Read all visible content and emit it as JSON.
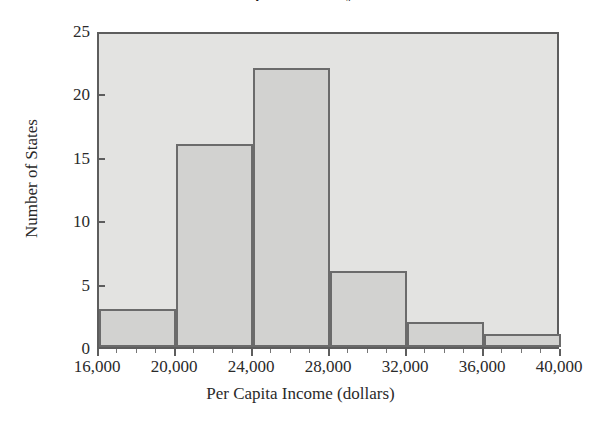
{
  "chart_data": {
    "type": "bar",
    "title": "Per Capita Income by State",
    "xlabel": "Per Capita Income (dollars)",
    "ylabel": "Number of States",
    "categories": [
      "16,000-20,000",
      "20,000-24,000",
      "24,000-28,000",
      "28,000-32,000",
      "32,000-36,000",
      "36,000-40,000"
    ],
    "bin_edges": [
      16000,
      20000,
      24000,
      28000,
      32000,
      36000,
      40000
    ],
    "values": [
      3,
      16,
      22,
      6,
      2,
      1
    ],
    "xlim": [
      16000,
      40000
    ],
    "ylim": [
      0,
      25
    ],
    "x_tick_labels": [
      "16,000",
      "20,000",
      "24,000",
      "28,000",
      "32,000",
      "36,000",
      "40,000"
    ],
    "x_tick_values": [
      16000,
      20000,
      24000,
      28000,
      32000,
      36000,
      40000
    ],
    "x_tick_step": 4000,
    "x_minor_step": 1000,
    "y_tick_labels": [
      "0",
      "5",
      "10",
      "15",
      "20",
      "25"
    ],
    "y_tick_values": [
      0,
      5,
      10,
      15,
      20,
      25
    ],
    "y_tick_step": 5,
    "grid": false,
    "legend": false,
    "legend_position": "none",
    "colors": {
      "plot_background": "#e3e3e1",
      "bar_fill": "#d2d2d0",
      "bar_outline": "#6b6b6b",
      "frame": "#5d5d5d",
      "text": "#2a2a2a",
      "page_background": "#ffffff"
    }
  }
}
